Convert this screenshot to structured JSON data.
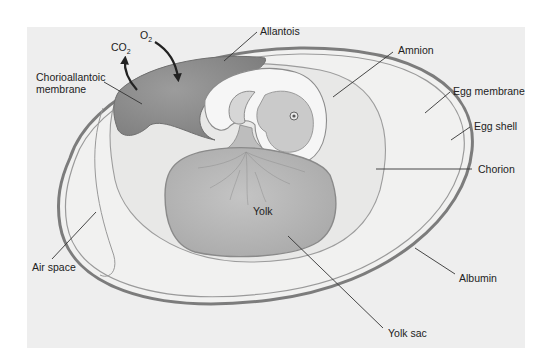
{
  "diagram": {
    "colors": {
      "panel_background": "#eeeeee",
      "shell": "#8a8a8a",
      "albumin": "#f1f1f0",
      "chorion_region": "#e9e9e8",
      "allantois": "#8f8f8f",
      "yolk": "#b9b9b9",
      "amnion": "#f6f6f6",
      "embryo": "#c9c9c9",
      "label_text": "#222222",
      "leader_line": "#333333"
    },
    "gases": {
      "o2": {
        "base": "O",
        "subscript": "2"
      },
      "co2": {
        "base": "CO",
        "subscript": "2"
      }
    },
    "labels": {
      "allantois": "Allantois",
      "chorioallantoic_line1": "Chorioallantoic",
      "chorioallantoic_line2": "membrane",
      "amnion": "Amnion",
      "egg_membrane": "Egg membrane",
      "egg_shell": "Egg shell",
      "chorion": "Chorion",
      "yolk": "Yolk",
      "air_space": "Air space",
      "albumin": "Albumin",
      "yolk_sac": "Yolk sac"
    }
  }
}
